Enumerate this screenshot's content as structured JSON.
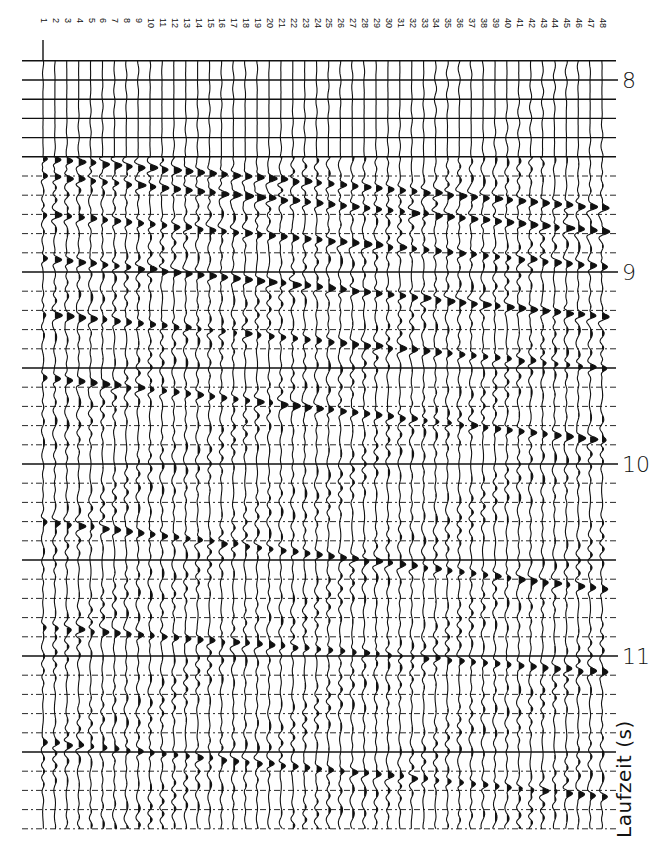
{
  "chart_data": {
    "type": "seismic-wiggle-trace",
    "title": "",
    "xlabel": "Trace number",
    "ylabel": "Laufzeit (s)",
    "traces": [
      1,
      2,
      3,
      4,
      5,
      6,
      7,
      8,
      9,
      10,
      11,
      12,
      13,
      14,
      15,
      16,
      17,
      18,
      19,
      20,
      21,
      22,
      23,
      24,
      25,
      26,
      27,
      28,
      29,
      30,
      31,
      32,
      33,
      34,
      35,
      36,
      37,
      38,
      39,
      40,
      41,
      42,
      43,
      44,
      45,
      46,
      47,
      48
    ],
    "y_ticks": [
      8,
      9,
      10,
      11
    ],
    "ylim": [
      7.88,
      11.92
    ],
    "timing_line_interval_s": 0.1,
    "grid": true,
    "layout": {
      "trace1_x": 43,
      "trace48_x": 602,
      "y_at_8s": 80,
      "px_per_second": 192,
      "top_timing_line_y": 60,
      "bottom_timing_line_y": 833,
      "strong_timing_lines_s": [
        7.9,
        8.0,
        8.1,
        8.2,
        8.3,
        8.4,
        9.0,
        9.5,
        10.0,
        10.5,
        11.0,
        11.5
      ],
      "record_onset_s": 8.4
    },
    "events": [
      {
        "name": "first arrival",
        "t0_s": 8.41,
        "moveout_s_per_trace": 0.0055,
        "strength": 1.0
      },
      {
        "name": "reflection A",
        "t0_s": 8.5,
        "moveout_s_per_trace": 0.0062,
        "strength": 1.0
      },
      {
        "name": "reflection B",
        "t0_s": 8.7,
        "moveout_s_per_trace": 0.0058,
        "strength": 0.9
      },
      {
        "name": "reflection C",
        "t0_s": 8.93,
        "moveout_s_per_trace": 0.0065,
        "strength": 1.0
      },
      {
        "name": "reflection D",
        "t0_s": 9.22,
        "moveout_s_per_trace": 0.006,
        "strength": 0.8
      },
      {
        "name": "reflection E",
        "t0_s": 9.55,
        "moveout_s_per_trace": 0.007,
        "strength": 0.85
      },
      {
        "name": "reflection F",
        "t0_s": 10.3,
        "moveout_s_per_trace": 0.0075,
        "strength": 0.8
      },
      {
        "name": "reflection G",
        "t0_s": 10.85,
        "moveout_s_per_trace": 0.005,
        "strength": 0.7
      },
      {
        "name": "reflection H",
        "t0_s": 11.45,
        "moveout_s_per_trace": 0.006,
        "strength": 0.7
      }
    ]
  },
  "labels": {
    "trace_labels": [
      "1",
      "2",
      "3",
      "4",
      "5",
      "6",
      "7",
      "8",
      "9",
      "10",
      "11",
      "12",
      "13",
      "14",
      "15",
      "16",
      "17",
      "18",
      "19",
      "20",
      "21",
      "22",
      "23",
      "24",
      "25",
      "26",
      "27",
      "28",
      "29",
      "30",
      "31",
      "32",
      "33",
      "34",
      "35",
      "36",
      "37",
      "38",
      "39",
      "40",
      "41",
      "42",
      "43",
      "44",
      "45",
      "46",
      "47",
      "48"
    ],
    "time_labels": [
      "8",
      "9",
      "10",
      "11"
    ],
    "axis_title": "Laufzeit (s)"
  },
  "colors": {
    "ink": "#111111",
    "background": "#ffffff"
  }
}
